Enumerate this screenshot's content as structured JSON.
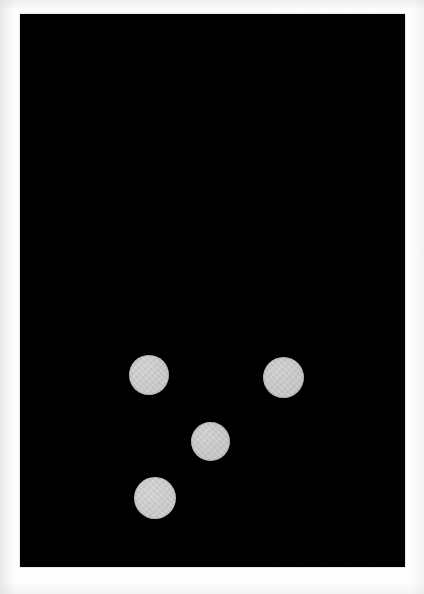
{
  "image": {
    "kind": "photograph",
    "caption_visible": false,
    "width_px": 424,
    "height_px": 594,
    "page_background_color": "#fdfdfd",
    "frame": {
      "name": "dark-field-photo",
      "x_px": 20,
      "y_px": 14,
      "width_px": 385,
      "height_px": 553,
      "background_color": "#000000"
    },
    "subject": {
      "description": "four pale round discs on a black background",
      "count": 4,
      "disc_color": "#cccccc"
    },
    "discs": [
      {
        "id": "disc-1",
        "label": "top-left disc",
        "center_x_px": 149,
        "center_y_px": 375,
        "diameter_px": 40,
        "color": "#cdcdcd"
      },
      {
        "id": "disc-2",
        "label": "top-right disc",
        "center_x_px": 283,
        "center_y_px": 377,
        "diameter_px": 41,
        "color": "#cacaca"
      },
      {
        "id": "disc-3",
        "label": "center disc",
        "center_x_px": 210,
        "center_y_px": 441,
        "diameter_px": 39,
        "color": "#cbcbcb"
      },
      {
        "id": "disc-4",
        "label": "bottom-left disc",
        "center_x_px": 155,
        "center_y_px": 498,
        "diameter_px": 42,
        "color": "#cfcfcf"
      }
    ]
  }
}
